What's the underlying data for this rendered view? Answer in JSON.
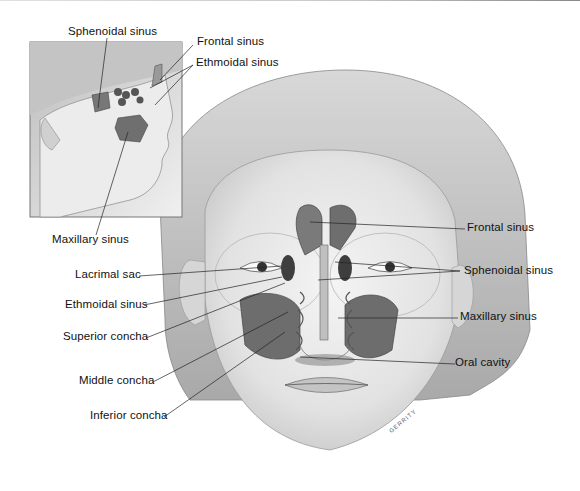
{
  "inset": {
    "labels": [
      {
        "id": "sphenoidal",
        "text": "Sphenoidal sinus"
      },
      {
        "id": "frontal",
        "text": "Frontal sinus"
      },
      {
        "id": "ethmoidal",
        "text": "Ethmoidal sinus"
      },
      {
        "id": "maxillary",
        "text": "Maxillary sinus"
      }
    ]
  },
  "front_view": {
    "left_labels": [
      {
        "id": "lacrimal",
        "text": "Lacrimal sac"
      },
      {
        "id": "ethmoidal",
        "text": "Ethmoidal sinus"
      },
      {
        "id": "superior-concha",
        "text": "Superior concha"
      },
      {
        "id": "middle-concha",
        "text": "Middle concha"
      },
      {
        "id": "inferior-concha",
        "text": "Inferior concha"
      }
    ],
    "right_labels": [
      {
        "id": "frontal",
        "text": "Frontal sinus"
      },
      {
        "id": "sphenoidal",
        "text": "Sphenoidal sinus"
      },
      {
        "id": "maxillary",
        "text": "Maxillary sinus"
      },
      {
        "id": "oral-cavity",
        "text": "Oral cavity"
      }
    ]
  },
  "signature": "GERRITY",
  "colors": {
    "skin": "#e9e9e9",
    "hair": "#b9b9b9",
    "sinus": "#6f6f6f",
    "line": "#222222"
  }
}
